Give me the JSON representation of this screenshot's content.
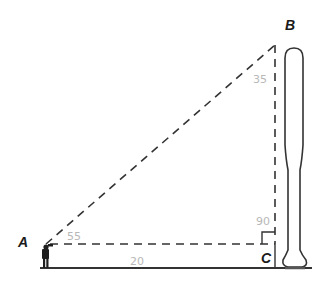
{
  "diagram": {
    "type": "right-triangle-word-problem",
    "vertices": {
      "A": {
        "label": "A",
        "x": 46,
        "y": 244
      },
      "B": {
        "label": "B",
        "x": 275,
        "y": 45
      },
      "C": {
        "label": "C",
        "x": 275,
        "y": 244
      }
    },
    "annotations": {
      "angle_A": "55",
      "angle_B": "35",
      "angle_C": "90",
      "side_AC": "20"
    },
    "objects": {
      "observer": "person-figure",
      "tall_object": "baseball-bat"
    },
    "colors": {
      "lines": "#333333",
      "handwriting": "#b8b8b8",
      "labels": "#1a1a1a"
    }
  }
}
